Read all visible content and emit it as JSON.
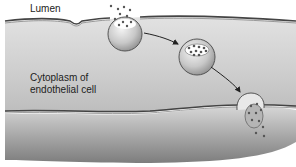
{
  "diagram": {
    "type": "biology-illustration",
    "labels": {
      "lumen": "Lumen",
      "cytoplasm_line1": "Cytoplasm of",
      "cytoplasm_line2": "endothelial cell"
    },
    "stages": [
      {
        "name": "endocytosis-at-luminal-membrane"
      },
      {
        "name": "vesicle-in-transit"
      },
      {
        "name": "exocytosis-at-basal-membrane"
      }
    ],
    "colors": {
      "cytoplasm_light": "#dcdcdc",
      "cytoplasm_dark": "#8a8a8a",
      "membrane": "#4a4a4a",
      "particle": "#555555"
    }
  }
}
